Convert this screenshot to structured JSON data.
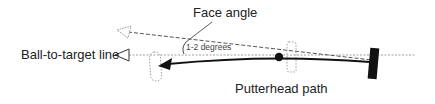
{
  "diagram": {
    "labels": {
      "face_angle": "Face angle",
      "angle_value": "1-2 degrees",
      "ball_to_target_line": "Ball-to-target line",
      "putterhead_path": "Putterhead path"
    },
    "colors": {
      "line": "#111111",
      "dashed": "#555555",
      "dotted": "#888888",
      "text": "#222222"
    }
  }
}
